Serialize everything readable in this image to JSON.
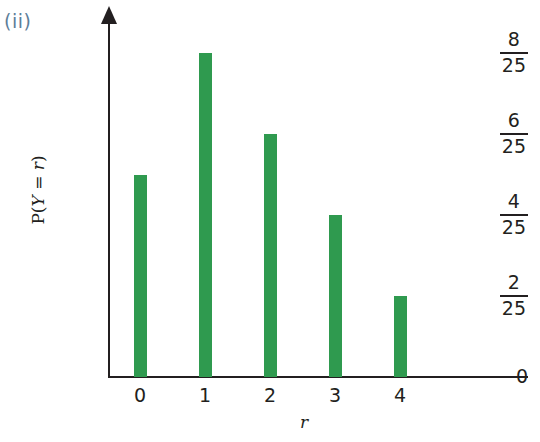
{
  "figure": {
    "part_label": "(ii)"
  },
  "chart_data": {
    "type": "bar",
    "title": "",
    "subtitle": "",
    "xlabel": "r",
    "ylabel": "P(Y = r)",
    "categories": [
      "0",
      "1",
      "2",
      "3",
      "4"
    ],
    "values": [
      0.2,
      0.32,
      0.24,
      0.16,
      0.08
    ],
    "value_labels": [
      "5/25",
      "8/25",
      "6/25",
      "4/25",
      "2/25"
    ],
    "ylim": [
      0,
      0.36
    ],
    "xlim": [
      -0.5,
      5.6
    ],
    "grid": false,
    "legend": null,
    "bar_color": "#2f9a4f",
    "axis_color": "#231f20",
    "y_ticks": [
      {
        "value": 0.32,
        "num": "8",
        "den": "25"
      },
      {
        "value": 0.24,
        "num": "6",
        "den": "25"
      },
      {
        "value": 0.16,
        "num": "4",
        "den": "25"
      },
      {
        "value": 0.08,
        "num": "2",
        "den": "25"
      }
    ],
    "y_zero_label": "0",
    "x_ticks": [
      "0",
      "1",
      "2",
      "3",
      "4"
    ],
    "ylabel_parts": {
      "prefix": "P(",
      "var": "Y",
      "eq": " = ",
      "rvar": "r",
      "suffix": ")"
    }
  }
}
